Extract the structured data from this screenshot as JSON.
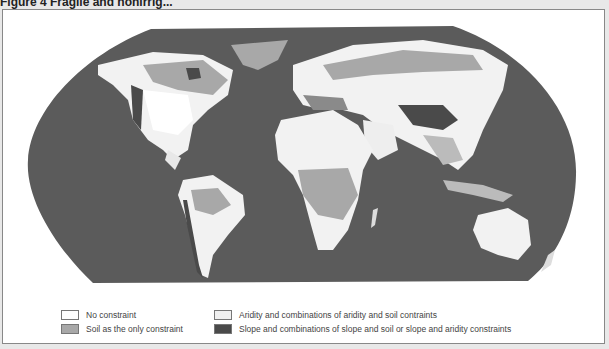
{
  "figure": {
    "title": "Figure 4   Fragile and nonirrig..."
  },
  "map": {
    "projection": "Robinson",
    "ocean_color": "#5a5a5a",
    "land_classes": [
      {
        "label": "No constraint",
        "color": "#ffffff"
      },
      {
        "label": "Soil as the only constraint",
        "color": "#a8a8a8"
      },
      {
        "label": "Aridity and combinations of aridity and soil contraints",
        "color": "#eeeeee"
      },
      {
        "label": "Slope and combinations of slope and soil or slope and aridity constraints",
        "color": "#4a4a4a"
      }
    ]
  },
  "legend": {
    "items": [
      {
        "label": "No constraint",
        "color": "#ffffff"
      },
      {
        "label": "Soil as the only constraint",
        "color": "#a8a8a8"
      },
      {
        "label": "Aridity and combinations of aridity and soil contraints",
        "color": "#f0f0f0"
      },
      {
        "label": "Slope and combinations of slope and soil or slope and aridity constraints",
        "color": "#4a4a4a"
      }
    ]
  }
}
